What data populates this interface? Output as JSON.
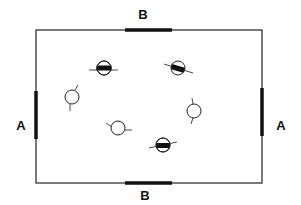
{
  "diagram": {
    "labels": {
      "top": "B",
      "bottom": "B",
      "left": "A",
      "right": "A"
    },
    "frame": {
      "x1": 36,
      "y1": 30,
      "x2": 262,
      "y2": 183,
      "color": "#222222"
    },
    "bars": {
      "top": {
        "x1": 125,
        "x2": 172,
        "y": 30
      },
      "bottom": {
        "x1": 125,
        "x2": 172,
        "y": 183
      },
      "left": {
        "x": 36,
        "y1": 91,
        "y2": 139
      },
      "right": {
        "x": 262,
        "y1": 88,
        "y2": 136
      }
    },
    "circles": [
      {
        "id": "c1",
        "cx": 104,
        "cy": 68,
        "filled_band": true,
        "band": "horizontal"
      },
      {
        "id": "c2",
        "cx": 178,
        "cy": 68,
        "filled_band": true,
        "band": "tilted"
      },
      {
        "id": "c3",
        "cx": 72,
        "cy": 97,
        "filled_band": false
      },
      {
        "id": "c4",
        "cx": 194,
        "cy": 111,
        "filled_band": false
      },
      {
        "id": "c5",
        "cx": 118,
        "cy": 128,
        "filled_band": false
      },
      {
        "id": "c6",
        "cx": 163,
        "cy": 145,
        "filled_band": true,
        "band": "horizontal"
      }
    ]
  }
}
